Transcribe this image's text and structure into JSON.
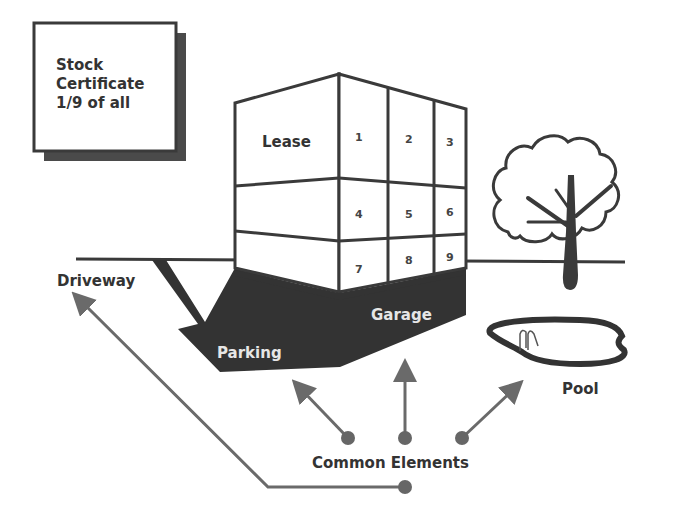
{
  "diagram": {
    "certificate": {
      "lines": [
        "Stock",
        "Certificate",
        "1/9 of all"
      ]
    },
    "building": {
      "lease_label": "Lease",
      "units": [
        "1",
        "2",
        "3",
        "4",
        "5",
        "6",
        "7",
        "8",
        "9"
      ]
    },
    "labels": {
      "driveway": "Driveway",
      "parking": "Parking",
      "garage": "Garage",
      "pool": "Pool",
      "common_elements": "Common Elements"
    },
    "icons": [
      "tree-icon",
      "pool-icon"
    ],
    "colors": {
      "line": "#3a3a3a",
      "dark_fill": "#333333",
      "arrow": "#6a6a6a",
      "shadow": "#4a4a4a",
      "text": "#333333"
    }
  }
}
